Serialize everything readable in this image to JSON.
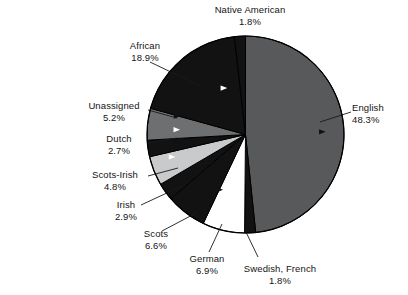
{
  "chart_data": {
    "type": "pie",
    "title": "",
    "subtitle": "",
    "xlabel": "",
    "ylabel": "",
    "legend_position": "none",
    "grid": false,
    "start_angle_deg": 0,
    "direction": "clockwise",
    "units": "percent",
    "categories": [
      "English",
      "Swedish, French",
      "German",
      "Scots",
      "Irish",
      "Scots-Irish",
      "Dutch",
      "Unassigned",
      "African",
      "Native American"
    ],
    "values": [
      48.3,
      1.8,
      6.9,
      6.6,
      2.9,
      4.8,
      2.7,
      5.2,
      18.9,
      1.8
    ],
    "slices": [
      {
        "label": "English",
        "value": 48.3,
        "value_text": "48.3%",
        "fill": "#58595b",
        "stroke": "#000000"
      },
      {
        "label": "Swedish, French",
        "value": 1.8,
        "value_text": "1.8%",
        "fill": "#121212",
        "stroke": "#000000"
      },
      {
        "label": "German",
        "value": 6.9,
        "value_text": "6.9%",
        "fill": "#ffffff",
        "stroke": "#000000"
      },
      {
        "label": "Scots",
        "value": 6.6,
        "value_text": "6.6%",
        "fill": "#121212",
        "stroke": "#000000"
      },
      {
        "label": "Irish",
        "value": 2.9,
        "value_text": "2.9%",
        "fill": "#121212",
        "stroke": "#000000"
      },
      {
        "label": "Scots-Irish",
        "value": 4.8,
        "value_text": "4.8%",
        "fill": "#c9cacb",
        "stroke": "#000000"
      },
      {
        "label": "Dutch",
        "value": 2.7,
        "value_text": "2.7%",
        "fill": "#121212",
        "stroke": "#000000"
      },
      {
        "label": "Unassigned",
        "value": 5.2,
        "value_text": "5.2%",
        "fill": "#6e6f71",
        "stroke": "#000000"
      },
      {
        "label": "African",
        "value": 18.9,
        "value_text": "18.9%",
        "fill": "#121212",
        "stroke": "#000000"
      },
      {
        "label": "Native American",
        "value": 1.8,
        "value_text": "1.8%",
        "fill": "#121212",
        "stroke": "#000000"
      }
    ]
  },
  "labels": {
    "native_american": {
      "name": "Native American",
      "pct": "1.8%"
    },
    "african": {
      "name": "African",
      "pct": "18.9%"
    },
    "unassigned": {
      "name": "Unassigned",
      "pct": "5.2%"
    },
    "dutch": {
      "name": "Dutch",
      "pct": "2.7%"
    },
    "scots_irish": {
      "name": "Scots-Irish",
      "pct": "4.8%"
    },
    "irish": {
      "name": "Irish",
      "pct": "2.9%"
    },
    "scots": {
      "name": "Scots",
      "pct": "6.6%"
    },
    "german": {
      "name": "German",
      "pct": "6.9%"
    },
    "swedish_french": {
      "name": "Swedish, French",
      "pct": "1.8%"
    },
    "english": {
      "name": "English",
      "pct": "48.3%"
    }
  },
  "caption": {
    "text": "opulation\nrom the\nnsus,\nhe United\n20-132,\ning Office,\nC."
  },
  "colors": {
    "background": "#ffffff",
    "text": "#141414",
    "dark_slice": "#121212",
    "mid_slice": "#58595b",
    "gray_slice": "#6e6f71",
    "light_slice": "#c9cacb",
    "white_slice": "#ffffff",
    "outline": "#000000"
  }
}
